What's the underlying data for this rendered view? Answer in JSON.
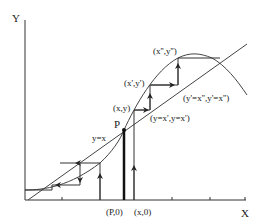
{
  "diagram": {
    "type": "cobweb-iteration-diagram",
    "axes": {
      "x_label": "X",
      "y_label": "Y"
    },
    "lines": {
      "diagonal_label": "y=x"
    },
    "point_labels": {
      "fixed_point": "P",
      "p_on_axis": "(P,0)",
      "x_on_axis": "(x,0)",
      "xy": "(x,y)",
      "xy_prime": "(x',y')",
      "xy_double_prime": "(x'',y'')",
      "step1": "(y=x',y=x')",
      "step2": "(y'=x'',y'=x'')"
    },
    "colors": {
      "ink": "#333333",
      "thick": "#111111",
      "background": "#ffffff"
    }
  }
}
